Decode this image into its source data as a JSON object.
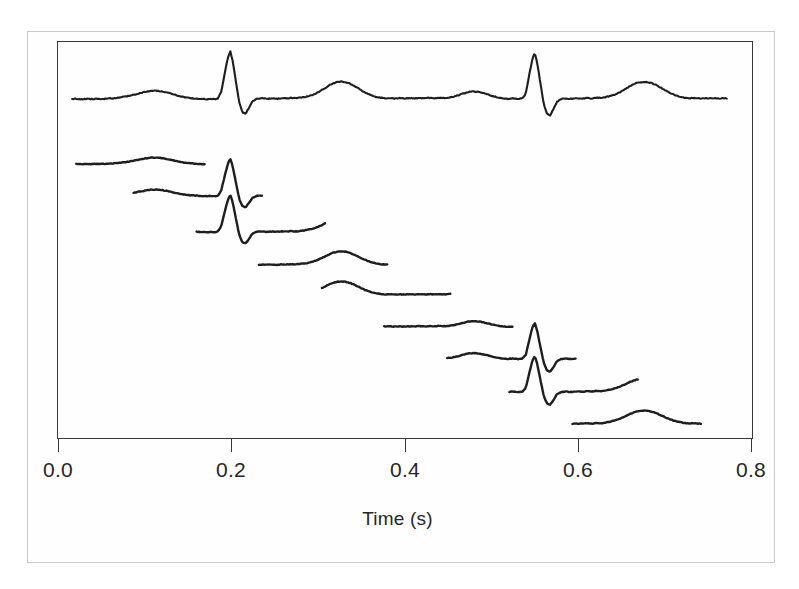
{
  "figure": {
    "kind": "ecg-segmentation-figure",
    "background_color": "#ffffff",
    "line_color": "#1e1e1e",
    "frame_color": "#3a3a3a",
    "page_border_color": "#c9c9c9"
  },
  "axis": {
    "title": "Time (s)",
    "tick_labels": [
      "0.0",
      "0.2",
      "0.4",
      "0.6",
      "0.8"
    ],
    "tick_values": [
      0.0,
      0.2,
      0.4,
      0.6,
      0.8
    ]
  },
  "chart_data": {
    "type": "line",
    "title": "",
    "subtitle": "",
    "xlabel": "Time (s)",
    "ylabel": "",
    "xlim": [
      -0.0185,
      0.8315
    ],
    "ylim": [
      0,
      1
    ],
    "grid": false,
    "legend": null,
    "x_unit": "s",
    "series": [
      {
        "name": "full-ecg-trace",
        "role": "full signal",
        "baseline_y_px": 99,
        "x_start": 0.0,
        "x_end": 0.8,
        "n_beats": 2,
        "points": [
          [
            0.0,
            0.0
          ],
          [
            0.006,
            0.002
          ],
          [
            0.012,
            -0.004
          ],
          [
            0.018,
            0.003
          ],
          [
            0.024,
            -0.002
          ],
          [
            0.03,
            0.004
          ],
          [
            0.036,
            0.0
          ],
          [
            0.042,
            0.006
          ],
          [
            0.048,
            0.01
          ],
          [
            0.054,
            0.018
          ],
          [
            0.06,
            0.03
          ],
          [
            0.066,
            0.046
          ],
          [
            0.072,
            0.062
          ],
          [
            0.078,
            0.082
          ],
          [
            0.084,
            0.105
          ],
          [
            0.09,
            0.125
          ],
          [
            0.096,
            0.138
          ],
          [
            0.102,
            0.142
          ],
          [
            0.108,
            0.134
          ],
          [
            0.114,
            0.118
          ],
          [
            0.12,
            0.095
          ],
          [
            0.126,
            0.07
          ],
          [
            0.132,
            0.046
          ],
          [
            0.138,
            0.028
          ],
          [
            0.144,
            0.016
          ],
          [
            0.15,
            0.008
          ],
          [
            0.156,
            0.002
          ],
          [
            0.162,
            -0.004
          ],
          [
            0.168,
            0.002
          ],
          [
            0.174,
            -0.006
          ],
          [
            0.178,
            0.01
          ],
          [
            0.182,
            0.12
          ],
          [
            0.186,
            0.42
          ],
          [
            0.19,
            0.7
          ],
          [
            0.193,
            0.83
          ],
          [
            0.196,
            0.66
          ],
          [
            0.2,
            0.3
          ],
          [
            0.204,
            -0.06
          ],
          [
            0.208,
            -0.23
          ],
          [
            0.212,
            -0.25
          ],
          [
            0.216,
            -0.15
          ],
          [
            0.22,
            -0.04
          ],
          [
            0.226,
            0.008
          ],
          [
            0.232,
            0.01
          ],
          [
            0.238,
            0.004
          ],
          [
            0.244,
            0.012
          ],
          [
            0.25,
            0.006
          ],
          [
            0.256,
            0.014
          ],
          [
            0.262,
            0.01
          ],
          [
            0.268,
            0.018
          ],
          [
            0.274,
            0.014
          ],
          [
            0.28,
            0.026
          ],
          [
            0.286,
            0.04
          ],
          [
            0.292,
            0.064
          ],
          [
            0.298,
            0.098
          ],
          [
            0.304,
            0.146
          ],
          [
            0.31,
            0.2
          ],
          [
            0.316,
            0.252
          ],
          [
            0.322,
            0.288
          ],
          [
            0.328,
            0.3
          ],
          [
            0.334,
            0.292
          ],
          [
            0.34,
            0.262
          ],
          [
            0.346,
            0.214
          ],
          [
            0.352,
            0.16
          ],
          [
            0.358,
            0.11
          ],
          [
            0.364,
            0.068
          ],
          [
            0.37,
            0.04
          ],
          [
            0.376,
            0.022
          ],
          [
            0.382,
            0.012
          ],
          [
            0.388,
            0.016
          ],
          [
            0.394,
            0.008
          ],
          [
            0.4,
            0.016
          ],
          [
            0.406,
            0.008
          ],
          [
            0.412,
            0.016
          ],
          [
            0.418,
            0.01
          ],
          [
            0.424,
            0.018
          ],
          [
            0.43,
            0.012
          ],
          [
            0.436,
            0.02
          ],
          [
            0.442,
            0.014
          ],
          [
            0.448,
            0.022
          ],
          [
            0.454,
            0.016
          ],
          [
            0.46,
            0.024
          ],
          [
            0.466,
            0.04
          ],
          [
            0.472,
            0.066
          ],
          [
            0.478,
            0.096
          ],
          [
            0.484,
            0.12
          ],
          [
            0.49,
            0.13
          ],
          [
            0.496,
            0.124
          ],
          [
            0.502,
            0.104
          ],
          [
            0.508,
            0.076
          ],
          [
            0.514,
            0.048
          ],
          [
            0.52,
            0.026
          ],
          [
            0.526,
            0.012
          ],
          [
            0.532,
            0.004
          ],
          [
            0.538,
            0.01
          ],
          [
            0.544,
            0.0
          ],
          [
            0.55,
            0.012
          ],
          [
            0.554,
            0.09
          ],
          [
            0.558,
            0.4
          ],
          [
            0.562,
            0.69
          ],
          [
            0.565,
            0.8
          ],
          [
            0.568,
            0.62
          ],
          [
            0.572,
            0.26
          ],
          [
            0.576,
            -0.09
          ],
          [
            0.58,
            -0.26
          ],
          [
            0.584,
            -0.28
          ],
          [
            0.588,
            -0.17
          ],
          [
            0.592,
            -0.05
          ],
          [
            0.598,
            0.004
          ],
          [
            0.604,
            0.008
          ],
          [
            0.61,
            0.002
          ],
          [
            0.616,
            0.012
          ],
          [
            0.622,
            0.006
          ],
          [
            0.628,
            0.016
          ],
          [
            0.634,
            0.01
          ],
          [
            0.64,
            0.022
          ],
          [
            0.646,
            0.018
          ],
          [
            0.652,
            0.034
          ],
          [
            0.658,
            0.054
          ],
          [
            0.664,
            0.084
          ],
          [
            0.67,
            0.124
          ],
          [
            0.676,
            0.176
          ],
          [
            0.682,
            0.228
          ],
          [
            0.688,
            0.268
          ],
          [
            0.694,
            0.292
          ],
          [
            0.7,
            0.296
          ],
          [
            0.706,
            0.282
          ],
          [
            0.712,
            0.25
          ],
          [
            0.718,
            0.202
          ],
          [
            0.724,
            0.15
          ],
          [
            0.73,
            0.104
          ],
          [
            0.736,
            0.066
          ],
          [
            0.742,
            0.04
          ],
          [
            0.748,
            0.022
          ],
          [
            0.754,
            0.012
          ],
          [
            0.76,
            0.016
          ],
          [
            0.766,
            0.008
          ],
          [
            0.772,
            0.016
          ],
          [
            0.778,
            0.008
          ],
          [
            0.784,
            0.016
          ],
          [
            0.79,
            0.01
          ],
          [
            0.796,
            0.018
          ],
          [
            0.8,
            0.012
          ]
        ]
      },
      {
        "name": "segment-1",
        "role": "sliding window",
        "index": 1,
        "x_start": 0.005,
        "x_end": 0.162,
        "baseline_y_px": 164,
        "feature": "P wave"
      },
      {
        "name": "segment-2",
        "role": "sliding window",
        "index": 2,
        "x_start": 0.075,
        "x_end": 0.232,
        "baseline_y_px": 196,
        "feature": "QRS complex"
      },
      {
        "name": "segment-3",
        "role": "sliding window",
        "index": 3,
        "x_start": 0.152,
        "x_end": 0.309,
        "baseline_y_px": 232,
        "feature": "ST segment / T wave onset"
      },
      {
        "name": "segment-4",
        "role": "sliding window",
        "index": 4,
        "x_start": 0.228,
        "x_end": 0.385,
        "baseline_y_px": 265,
        "feature": "T wave"
      },
      {
        "name": "segment-5",
        "role": "sliding window",
        "index": 5,
        "x_start": 0.305,
        "x_end": 0.462,
        "baseline_y_px": 295,
        "feature": "isoelectric baseline"
      },
      {
        "name": "segment-6",
        "role": "sliding window",
        "index": 6,
        "x_start": 0.381,
        "x_end": 0.538,
        "baseline_y_px": 327,
        "feature": "P wave"
      },
      {
        "name": "segment-7",
        "role": "sliding window",
        "index": 7,
        "x_start": 0.458,
        "x_end": 0.615,
        "baseline_y_px": 359,
        "feature": "QRS complex"
      },
      {
        "name": "segment-8",
        "role": "sliding window",
        "index": 8,
        "x_start": 0.534,
        "x_end": 0.691,
        "baseline_y_px": 392,
        "feature": "ST segment / T wave"
      },
      {
        "name": "segment-9",
        "role": "sliding window",
        "index": 9,
        "x_start": 0.611,
        "x_end": 0.768,
        "baseline_y_px": 424,
        "feature": "T wave"
      }
    ]
  }
}
